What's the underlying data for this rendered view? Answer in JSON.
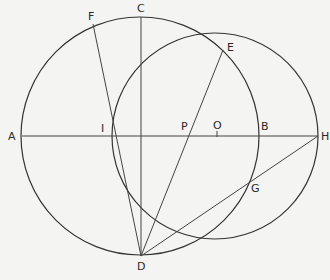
{
  "diagram": {
    "type": "geometric-construction",
    "background": "#f4f4f2",
    "ink": "#333333",
    "circles": [
      {
        "name": "large-circle",
        "cx": 140,
        "cy": 136,
        "r": 119
      },
      {
        "name": "small-circle",
        "cx": 215,
        "cy": 136,
        "r": 103
      }
    ],
    "points": {
      "A": {
        "x": 22,
        "y": 136
      },
      "B": {
        "x": 258,
        "y": 136
      },
      "C": {
        "x": 141,
        "y": 17
      },
      "D": {
        "x": 141,
        "y": 256
      },
      "E": {
        "x": 223,
        "y": 50
      },
      "F": {
        "x": 93,
        "y": 24
      },
      "G": {
        "x": 248,
        "y": 183
      },
      "H": {
        "x": 318,
        "y": 136
      },
      "I": {
        "x": 113,
        "y": 136
      },
      "O": {
        "x": 217,
        "y": 136
      },
      "P": {
        "x": 188,
        "y": 136
      }
    },
    "labels": {
      "A": "A",
      "B": "B",
      "C": "C",
      "D": "D",
      "E": "E",
      "F": "F",
      "G": "G",
      "H": "H",
      "I": "I",
      "O": "O",
      "P": "P"
    },
    "segments": [
      [
        "A",
        "H"
      ],
      [
        "C",
        "D"
      ],
      [
        "F",
        "D"
      ],
      [
        "E",
        "D"
      ],
      [
        "H",
        "D"
      ]
    ]
  }
}
